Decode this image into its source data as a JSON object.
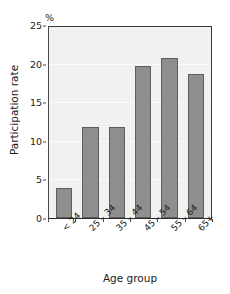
{
  "chart_data": {
    "type": "bar",
    "title": "",
    "subtitle": "",
    "categories": [
      "< 24",
      "25 – 34",
      "35 – 44",
      "45 – 54",
      "55 – 64",
      "65+"
    ],
    "values": [
      4,
      12,
      12,
      20,
      21,
      19
    ],
    "series": [
      {
        "name": "Participation rate",
        "values": [
          4,
          12,
          12,
          20,
          21,
          19
        ]
      }
    ],
    "xlabel": "Age group",
    "ylabel": "Participation rate",
    "unit_label": "%",
    "ylim": [
      0,
      25
    ],
    "yticks": [
      0,
      5,
      10,
      15,
      20,
      25
    ],
    "ytick_labels": [
      "0",
      "5",
      "10",
      "15",
      "20",
      "25"
    ],
    "grid": true,
    "legend": false,
    "legend_position": "none",
    "bar_color": "#8e8e8e",
    "bar_edge_color": "#5e5e5e",
    "plot_background": "#f1f1f1",
    "gridline_color": "#fbfbfb",
    "axis_color": "#2b2b2b",
    "xtick_label_rotation": -45
  }
}
